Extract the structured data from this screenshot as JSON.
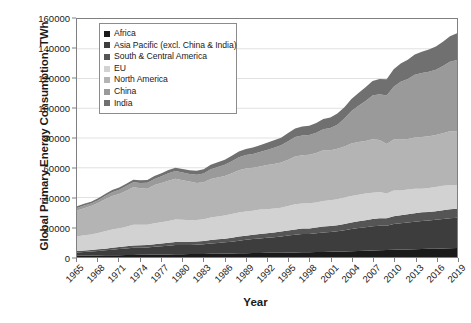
{
  "chart": {
    "type": "area",
    "title": "",
    "xlabel": "Year",
    "ylabel": "Global Primary Energy Consumption, TWh",
    "grid": true,
    "legend_position": "top-left-inside",
    "ylim": [
      0,
      160000
    ],
    "ytick_labels": [
      "160000",
      "140000",
      "120000",
      "100000",
      "80000",
      "60000",
      "40000",
      "20000",
      "0"
    ],
    "ytick_values": [
      160000,
      140000,
      120000,
      100000,
      80000,
      60000,
      40000,
      20000,
      0
    ],
    "xtick_labels": [
      "1965",
      "1968",
      "1971",
      "1974",
      "1977",
      "1980",
      "1983",
      "1986",
      "1989",
      "1992",
      "1995",
      "1998",
      "2001",
      "2004",
      "2007",
      "2010",
      "2013",
      "2016",
      "2019"
    ],
    "legend_items": [
      {
        "label": "Africa",
        "color": "#1a1a1a"
      },
      {
        "label": "Asia Pacific (excl. China & India)",
        "color": "#3d3d3d"
      },
      {
        "label": "South & Central America",
        "color": "#555555"
      },
      {
        "label": "EU",
        "color": "#d2d2d2"
      },
      {
        "label": "North America",
        "color": "#b4b4b4"
      },
      {
        "label": "China",
        "color": "#9a9a9a"
      },
      {
        "label": "India",
        "color": "#707070"
      }
    ]
  },
  "chart_data": {
    "type": "area",
    "stacked": true,
    "title": "",
    "xlabel": "Year",
    "ylabel": "Global Primary Energy Consumption, TWh",
    "units": "TWh",
    "ylim": [
      0,
      160000
    ],
    "xlim": [
      1965,
      2019
    ],
    "grid": true,
    "legend_position": "top-left-inside",
    "x": [
      1965,
      1966,
      1967,
      1968,
      1969,
      1970,
      1971,
      1972,
      1973,
      1974,
      1975,
      1976,
      1977,
      1978,
      1979,
      1980,
      1981,
      1982,
      1983,
      1984,
      1985,
      1986,
      1987,
      1988,
      1989,
      1990,
      1991,
      1992,
      1993,
      1994,
      1995,
      1996,
      1997,
      1998,
      1999,
      2000,
      2001,
      2002,
      2003,
      2004,
      2005,
      2006,
      2007,
      2008,
      2009,
      2010,
      2011,
      2012,
      2013,
      2014,
      2015,
      2016,
      2017,
      2018,
      2019
    ],
    "series": [
      {
        "name": "Africa",
        "color": "#1a1a1a",
        "values": [
          900,
          950,
          1000,
          1060,
          1120,
          1200,
          1260,
          1320,
          1400,
          1450,
          1520,
          1600,
          1680,
          1760,
          1840,
          1920,
          1980,
          2040,
          2100,
          2180,
          2260,
          2340,
          2420,
          2500,
          2580,
          2660,
          2720,
          2780,
          2840,
          2900,
          2980,
          3080,
          3160,
          3240,
          3320,
          3420,
          3520,
          3640,
          3780,
          3940,
          4100,
          4260,
          4420,
          4580,
          4680,
          4840,
          4960,
          5100,
          5240,
          5380,
          5480,
          5580,
          5700,
          5840,
          5980
        ]
      },
      {
        "name": "Asia Pacific (excl. China & India)",
        "color": "#3d3d3d",
        "values": [
          2200,
          2450,
          2700,
          3000,
          3350,
          3750,
          4050,
          4400,
          4850,
          4800,
          4900,
          5250,
          5550,
          5800,
          6150,
          6150,
          6150,
          6200,
          6450,
          6900,
          7200,
          7500,
          7900,
          8500,
          9000,
          9450,
          9800,
          10150,
          10500,
          10900,
          11450,
          11900,
          12300,
          12150,
          12600,
          13100,
          13300,
          13700,
          14200,
          14900,
          15400,
          15800,
          16300,
          16500,
          16400,
          17300,
          17700,
          18100,
          18500,
          18800,
          19000,
          19400,
          19800,
          20200,
          20400
        ]
      },
      {
        "name": "South & Central America",
        "color": "#555555",
        "values": [
          900,
          950,
          1000,
          1070,
          1150,
          1250,
          1340,
          1440,
          1560,
          1650,
          1700,
          1800,
          1900,
          2000,
          2100,
          2150,
          2150,
          2180,
          2220,
          2320,
          2400,
          2500,
          2600,
          2700,
          2780,
          2850,
          2950,
          3050,
          3150,
          3280,
          3420,
          3560,
          3700,
          3800,
          3850,
          3950,
          3950,
          4050,
          4150,
          4350,
          4520,
          4680,
          4880,
          5050,
          5020,
          5300,
          5450,
          5600,
          5750,
          5850,
          5850,
          5850,
          5950,
          6050,
          6100
        ]
      },
      {
        "name": "EU",
        "color": "#d2d2d2",
        "values": [
          9800,
          10200,
          10500,
          11000,
          11700,
          12300,
          12700,
          13200,
          13900,
          13700,
          13500,
          14100,
          14300,
          14700,
          15200,
          14900,
          14500,
          14400,
          14600,
          15100,
          15400,
          15600,
          16000,
          16200,
          16200,
          16100,
          16400,
          16200,
          16100,
          16000,
          16400,
          16900,
          16800,
          16900,
          16900,
          17100,
          17400,
          17400,
          17800,
          17900,
          17900,
          17900,
          17600,
          17500,
          16600,
          17200,
          16600,
          16500,
          16400,
          15900,
          16100,
          16300,
          16400,
          16200,
          16000
        ]
      },
      {
        "name": "North America",
        "color": "#b4b4b4",
        "values": [
          17500,
          18300,
          19100,
          20200,
          21500,
          22500,
          23000,
          24200,
          25200,
          24700,
          24300,
          25600,
          26300,
          27000,
          27300,
          26500,
          25900,
          25000,
          24900,
          26000,
          26200,
          26500,
          27400,
          28500,
          29000,
          29000,
          29000,
          29600,
          30000,
          30500,
          31200,
          32200,
          32500,
          32700,
          33300,
          34200,
          33600,
          34000,
          34400,
          35200,
          35400,
          35300,
          35900,
          35100,
          33300,
          34400,
          34300,
          34000,
          34500,
          34700,
          34800,
          34900,
          35400,
          36200,
          35900
        ]
      },
      {
        "name": "China",
        "color": "#9a9a9a",
        "values": [
          1700,
          1850,
          1600,
          1900,
          2200,
          2600,
          2900,
          3100,
          3400,
          3500,
          4000,
          4100,
          4500,
          5000,
          5200,
          5200,
          5200,
          5500,
          5900,
          6500,
          7100,
          7500,
          8100,
          8700,
          9000,
          9200,
          9700,
          10200,
          10900,
          11500,
          12400,
          13000,
          13200,
          13200,
          13500,
          14100,
          14900,
          16200,
          18700,
          21800,
          24300,
          27000,
          29500,
          30700,
          32500,
          35400,
          38800,
          40300,
          42200,
          43100,
          43300,
          43900,
          45200,
          46700,
          48100
        ]
      },
      {
        "name": "India",
        "color": "#707070",
        "values": [
          1100,
          1150,
          1200,
          1280,
          1360,
          1450,
          1520,
          1600,
          1680,
          1750,
          1850,
          1950,
          2050,
          2150,
          2250,
          2350,
          2500,
          2650,
          2800,
          3000,
          3200,
          3400,
          3600,
          3850,
          4100,
          4350,
          4550,
          4750,
          4950,
          5150,
          5500,
          5800,
          6050,
          6250,
          6600,
          6900,
          7100,
          7400,
          7700,
          8200,
          8650,
          9200,
          9800,
          10300,
          11000,
          11700,
          12200,
          13000,
          13500,
          14300,
          14900,
          15500,
          16300,
          17200,
          17900
        ]
      }
    ]
  }
}
